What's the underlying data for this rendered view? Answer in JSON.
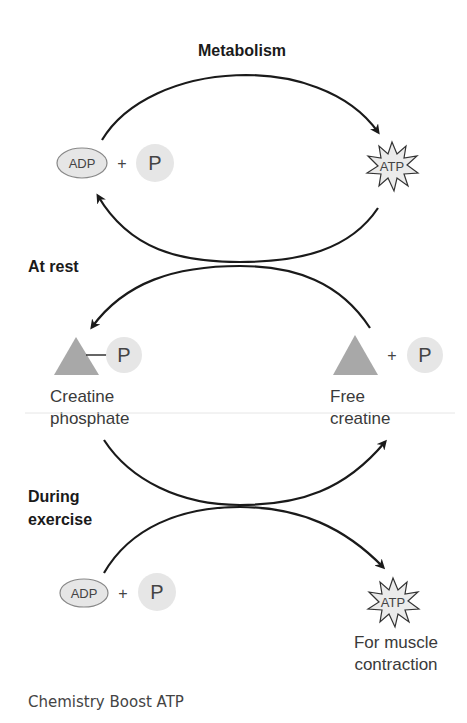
{
  "diagram": {
    "title": "Metabolism",
    "sections": {
      "at_rest": "At rest",
      "during_exercise_line1": "During",
      "during_exercise_line2": "exercise"
    },
    "molecules": {
      "adp": "ADP",
      "phosphate": "P",
      "plus": "+",
      "atp": "ATP"
    },
    "labels": {
      "creatine_phosphate_line1": "Creatine",
      "creatine_phosphate_line2": "phosphate",
      "free_creatine_line1": "Free",
      "free_creatine_line2": "creatine",
      "muscle_line1": "For muscle",
      "muscle_line2": "contraction"
    },
    "colors": {
      "arrow": "#1a1a1a",
      "molecule_fill": "#e6e6e6",
      "molecule_stroke": "#888888",
      "triangle_fill": "#a8a8a8",
      "starburst_fill": "#ebebeb"
    }
  },
  "caption": "Chemistry Boost ATP"
}
